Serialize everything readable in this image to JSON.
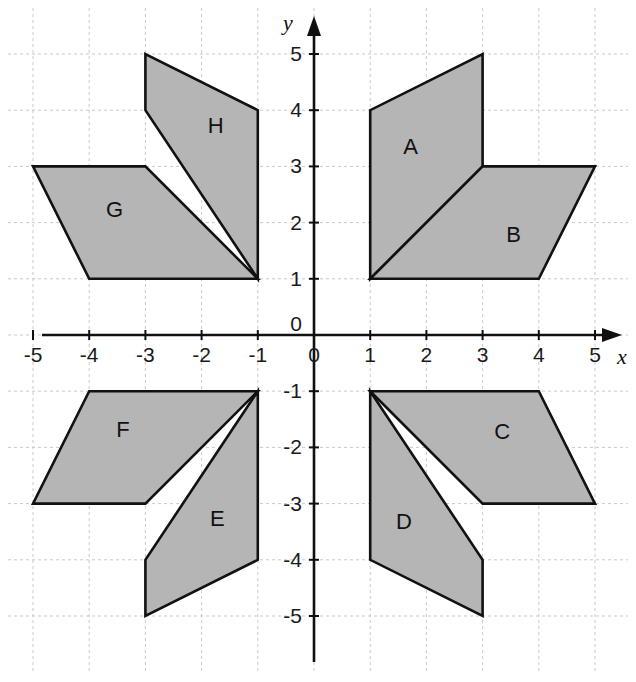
{
  "figure": {
    "type": "coordinate-grid-shapes",
    "background_color": "#ffffff",
    "grid_color": "#c9c9cf",
    "axis_color": "#101010",
    "shape_fill": "#b5b5b5",
    "shape_stroke": "#111111",
    "axes": {
      "x_label": "x",
      "y_label": "y",
      "x_range": [
        -5.6,
        5.6
      ],
      "y_range": [
        -5.6,
        5.6
      ],
      "x_ticks": [
        "-5",
        "-4",
        "-3",
        "-2",
        "-1",
        "1",
        "2",
        "3",
        "4",
        "5"
      ],
      "x_tick_values": [
        -5,
        -4,
        -3,
        -2,
        -1,
        1,
        2,
        3,
        4,
        5
      ],
      "y_ticks": [
        "5",
        "4",
        "3",
        "2",
        "1",
        "-1",
        "-2",
        "-3",
        "-4",
        "-5"
      ],
      "y_tick_values": [
        5,
        4,
        3,
        2,
        1,
        -1,
        -2,
        -3,
        -4,
        -5
      ],
      "origin_label_x": "0",
      "origin_label_y": "0",
      "grid": true,
      "grid_style": "dashed"
    },
    "shapes": [
      {
        "label": "A",
        "label_pos": [
          1.72,
          3.32
        ],
        "vertices": [
          [
            1,
            1
          ],
          [
            1,
            4
          ],
          [
            3,
            5
          ],
          [
            3,
            3
          ]
        ]
      },
      {
        "label": "B",
        "label_pos": [
          3.55,
          1.75
        ],
        "vertices": [
          [
            1,
            1
          ],
          [
            4,
            1
          ],
          [
            5,
            3
          ],
          [
            3,
            3
          ]
        ]
      },
      {
        "label": "C",
        "label_pos": [
          3.35,
          -1.75
        ],
        "vertices": [
          [
            1,
            -1
          ],
          [
            4,
            -1
          ],
          [
            5,
            -3
          ],
          [
            3,
            -3
          ]
        ]
      },
      {
        "label": "D",
        "label_pos": [
          1.6,
          -3.35
        ],
        "vertices": [
          [
            1,
            -1
          ],
          [
            1,
            -4
          ],
          [
            3,
            -5
          ],
          [
            3,
            -4
          ]
        ]
      },
      {
        "label": "E",
        "label_pos": [
          -1.72,
          -3.3
        ],
        "vertices": [
          [
            -1,
            -1
          ],
          [
            -1,
            -4
          ],
          [
            -3,
            -5
          ],
          [
            -3,
            -4
          ]
        ]
      },
      {
        "label": "F",
        "label_pos": [
          -3.4,
          -1.72
        ],
        "vertices": [
          [
            -1,
            -1
          ],
          [
            -4,
            -1
          ],
          [
            -5,
            -3
          ],
          [
            -3,
            -3
          ]
        ]
      },
      {
        "label": "G",
        "label_pos": [
          -3.55,
          2.2
        ],
        "vertices": [
          [
            -1,
            1
          ],
          [
            -4,
            1
          ],
          [
            -5,
            3
          ],
          [
            -3,
            3
          ]
        ]
      },
      {
        "label": "H",
        "label_pos": [
          -1.75,
          3.7
        ],
        "vertices": [
          [
            -1,
            1
          ],
          [
            -1,
            4
          ],
          [
            -3,
            5
          ],
          [
            -3,
            4
          ]
        ]
      }
    ]
  }
}
